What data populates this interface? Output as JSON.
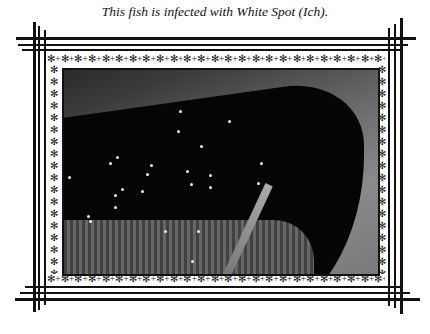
{
  "caption": "This fish is infected with White Spot (Ich).",
  "figure": {
    "frame_style": "triple-line border with star ornament band",
    "ornament_glyph": "✻"
  },
  "colors": {
    "ink": "#111111",
    "background": "#ffffff"
  }
}
